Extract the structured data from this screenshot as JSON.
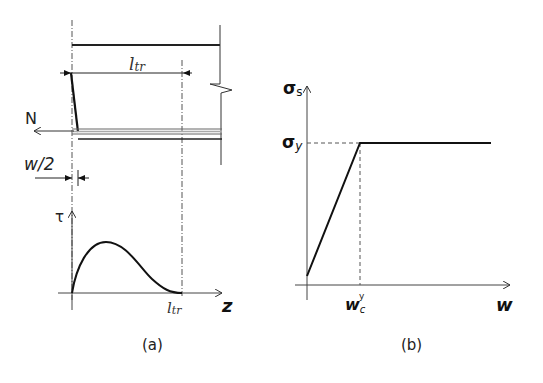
{
  "figure": {
    "panels": [
      {
        "id": "a",
        "caption": "(a)",
        "labels": {
          "force": "N",
          "transfer_length": "l",
          "transfer_length_sub": "tr",
          "half_crack_width": "w/2",
          "bond_stress_axis": "τ",
          "position_axis": "z",
          "axis_length_tick": "l",
          "axis_length_tick_sub": "tr"
        },
        "description": "Cracked reinforced concrete member with bar pulled by force N; transfer length l_tr; bond stress τ distribution along z vanishing at l_tr"
      },
      {
        "id": "b",
        "caption": "(b)",
        "labels": {
          "y_axis": "σ",
          "y_axis_sub": "s",
          "yield_level": "σ",
          "yield_level_sub": "y",
          "x_axis": "w",
          "yield_width": "w",
          "yield_width_sub": "c",
          "yield_width_sup": "y"
        },
        "description": "Steel stress vs crack width: linear rise to σy at w_c^y then constant plateau"
      }
    ],
    "colors": {
      "line": "#222222",
      "dashed": "#555555",
      "rebar": "#888888",
      "background": "#ffffff"
    }
  }
}
